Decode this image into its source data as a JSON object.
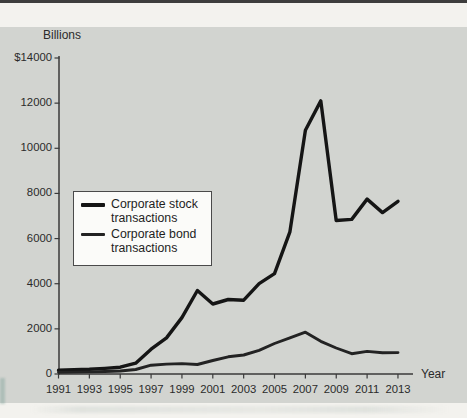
{
  "figure": {
    "y_axis_title": "Billions",
    "x_axis_title": "Year",
    "y_tick_labels": [
      "$14000",
      "12000",
      "10000",
      "8000",
      "6000",
      "4000",
      "2000",
      "0"
    ],
    "x_tick_labels": [
      "1991",
      "1993",
      "1995",
      "1997",
      "1999",
      "2001",
      "2003",
      "2005",
      "2007",
      "2009",
      "2011",
      "2013"
    ],
    "colors": {
      "page_background": "#f3f2ee",
      "panel_background": "#d2d4d0",
      "top_bar": "#3d3d3d",
      "axis": "#3a3a3a",
      "stock_line": "#151515",
      "bond_line": "#232323",
      "legend_background": "#fbfbf9",
      "legend_border": "#4a4a4a",
      "text": "#2b2b2b"
    }
  },
  "legend": {
    "items": [
      {
        "label": "Corporate stock transactions"
      },
      {
        "label": "Corporate bond transactions"
      }
    ]
  },
  "chart_data": {
    "type": "line",
    "title": "",
    "xlabel": "Year",
    "ylabel": "Billions",
    "ylim": [
      0,
      14000
    ],
    "y_tick_step": 2000,
    "grid": false,
    "legend_position": "middle-left",
    "x": [
      1991,
      1992,
      1993,
      1994,
      1995,
      1996,
      1997,
      1998,
      1999,
      2000,
      2001,
      2002,
      2003,
      2004,
      2005,
      2006,
      2007,
      2008,
      2009,
      2010,
      2011,
      2012,
      2013
    ],
    "x_tick_years": [
      1991,
      1993,
      1995,
      1997,
      1999,
      2001,
      2003,
      2005,
      2007,
      2009,
      2011,
      2013
    ],
    "series": [
      {
        "name": "Corporate stock transactions",
        "values": [
          170,
          185,
          210,
          250,
          300,
          480,
          1100,
          1600,
          2500,
          3700,
          3100,
          3300,
          3270,
          4000,
          4450,
          6300,
          10800,
          12100,
          6800,
          6850,
          7750,
          7150,
          7650
        ]
      },
      {
        "name": "Corporate bond transactions",
        "values": [
          75,
          85,
          95,
          110,
          135,
          200,
          390,
          440,
          460,
          420,
          600,
          760,
          840,
          1050,
          1350,
          1600,
          1850,
          1450,
          1150,
          900,
          1000,
          940,
          950
        ]
      }
    ]
  }
}
